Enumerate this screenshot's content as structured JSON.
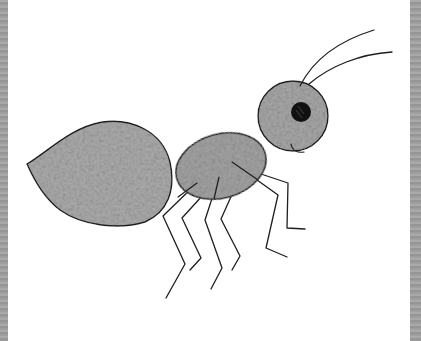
{
  "image": {
    "subject": "pencil drawing of a cartoon ant",
    "colors": {
      "paper": "#ffffff",
      "frame": "#9a9a9a",
      "outline": "#1e1e1e",
      "body_fill": "#a8a8a8",
      "body_fill_light": "#c4c4c4",
      "eye": "#111111"
    },
    "parts": [
      "abdomen",
      "thorax",
      "head",
      "eye",
      "smile",
      "antenna-left",
      "antenna-right",
      "legs"
    ]
  }
}
